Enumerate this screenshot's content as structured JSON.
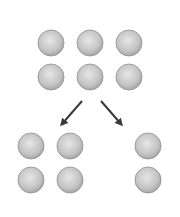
{
  "diagram": {
    "background": "#ffffff",
    "ball_color_light": "#e2e2e2",
    "ball_color_dark": "#a8a8a8",
    "ball_stroke": "#8f8f8f",
    "arrow_color": "#3a3a3a",
    "radius": 13,
    "top_group": {
      "label": "6 balls",
      "balls": [
        {
          "cx": 51,
          "cy": 43
        },
        {
          "cx": 90,
          "cy": 43
        },
        {
          "cx": 129,
          "cy": 43
        },
        {
          "cx": 51,
          "cy": 77
        },
        {
          "cx": 90,
          "cy": 77
        },
        {
          "cx": 129,
          "cy": 77
        }
      ]
    },
    "arrows": [
      {
        "name": "arrow-left",
        "x1": 82,
        "y1": 101,
        "x2": 62,
        "y2": 124
      },
      {
        "name": "arrow-right",
        "x1": 101,
        "y1": 101,
        "x2": 121,
        "y2": 124
      }
    ],
    "left_group": {
      "label": "4 balls",
      "balls": [
        {
          "cx": 31,
          "cy": 146
        },
        {
          "cx": 70,
          "cy": 146
        },
        {
          "cx": 31,
          "cy": 180
        },
        {
          "cx": 70,
          "cy": 180
        }
      ]
    },
    "right_group": {
      "label": "2 balls",
      "balls": [
        {
          "cx": 148,
          "cy": 146
        },
        {
          "cx": 148,
          "cy": 180
        }
      ]
    }
  }
}
